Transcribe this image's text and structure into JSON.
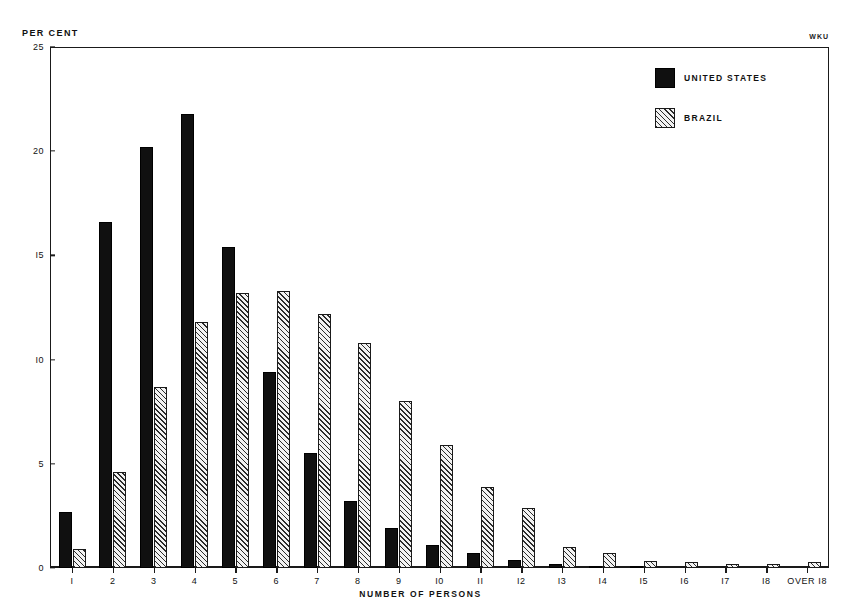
{
  "chart_data": {
    "type": "bar",
    "title": "",
    "xlabel": "NUMBER OF PERSONS",
    "ylabel": "PER CENT",
    "ylim": [
      0,
      25
    ],
    "yticks": [
      0,
      5,
      10,
      15,
      20,
      25
    ],
    "ytick_labels": [
      "0",
      "5",
      "I0",
      "I5",
      "20",
      "25"
    ],
    "grid": false,
    "legend_position": "top-right",
    "categories": [
      "1",
      "2",
      "3",
      "4",
      "5",
      "6",
      "7",
      "8",
      "9",
      "10",
      "11",
      "12",
      "13",
      "14",
      "15",
      "16",
      "17",
      "18",
      "OVER 18"
    ],
    "category_labels": [
      "I",
      "2",
      "3",
      "4",
      "5",
      "6",
      "7",
      "8",
      "9",
      "I0",
      "II",
      "I2",
      "I3",
      "I4",
      "I5",
      "I6",
      "I7",
      "I8",
      "OVER I8"
    ],
    "series": [
      {
        "name": "UNITED STATES",
        "color": "#101010",
        "fill": "solid",
        "values": [
          2.7,
          16.6,
          20.2,
          21.8,
          15.4,
          9.4,
          5.5,
          3.2,
          1.9,
          1.1,
          0.7,
          0.4,
          0.2,
          0.1,
          0.05,
          0.0,
          0.0,
          0.0,
          0.0
        ]
      },
      {
        "name": "BRAZIL",
        "color": "#2b2b2b",
        "fill": "diagonal-hatch",
        "values": [
          0.9,
          4.6,
          8.7,
          11.8,
          13.2,
          13.3,
          12.2,
          10.8,
          8.0,
          5.9,
          3.9,
          2.9,
          1.0,
          0.7,
          0.35,
          0.3,
          0.2,
          0.18,
          0.3
        ]
      }
    ]
  },
  "annotations": {
    "corner_mark": "WKU"
  },
  "legend": {
    "items": [
      {
        "label": "UNITED STATES",
        "style": "solid"
      },
      {
        "label": "BRAZIL",
        "style": "hatch"
      }
    ]
  }
}
